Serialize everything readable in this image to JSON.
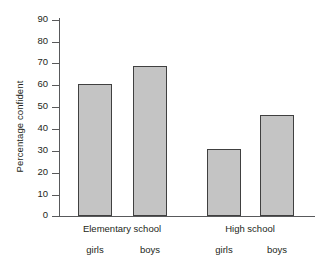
{
  "chart_data": {
    "type": "bar",
    "title": "",
    "xlabel": "",
    "ylabel": "Percentage confident",
    "ylim": [
      0,
      90
    ],
    "ytick_step": 10,
    "yticks": [
      90,
      80,
      70,
      60,
      50,
      40,
      30,
      20,
      10,
      0
    ],
    "grid": false,
    "legend": "none",
    "groups": [
      {
        "label": "Elementary school",
        "categories": [
          "girls",
          "boys"
        ],
        "values": [
          60,
          68
        ]
      },
      {
        "label": "High school",
        "categories": [
          "girls",
          "boys"
        ],
        "values": [
          30.5,
          46
        ]
      }
    ],
    "categories": [
      "girls",
      "boys",
      "girls",
      "boys"
    ],
    "values": [
      60,
      68,
      30.5,
      46
    ],
    "bar_fill_color": "#c4c4c4",
    "bar_border_color": "#404040",
    "axis_color": "#58595b",
    "background_color": "#ffffff"
  },
  "bars": [
    {
      "label": "girls",
      "value": 60,
      "left": 19,
      "width": 34,
      "height_pct": 66.67
    },
    {
      "label": "boys",
      "value": 68,
      "left": 74,
      "width": 34,
      "height_pct": 75.56
    },
    {
      "label": "girls",
      "value": 30.5,
      "left": 148,
      "width": 34,
      "height_pct": 33.89
    },
    {
      "label": "boys",
      "value": 46,
      "left": 201,
      "width": 34,
      "height_pct": 51.11
    }
  ],
  "yticks": [
    {
      "label": "90",
      "top": 20
    },
    {
      "label": "80",
      "top": 42
    },
    {
      "label": "70",
      "top": 63
    },
    {
      "label": "60",
      "top": 85
    },
    {
      "label": "50",
      "top": 107
    },
    {
      "label": "40",
      "top": 129
    },
    {
      "label": "30",
      "top": 151
    },
    {
      "label": "20",
      "top": 173
    },
    {
      "label": "10",
      "top": 195
    },
    {
      "label": "0",
      "top": 216
    }
  ],
  "group_labels": [
    {
      "text": "Elementary school",
      "center": 122
    },
    {
      "text": "High school",
      "center": 250
    }
  ],
  "sub_labels": [
    {
      "text": "girls",
      "center": 95
    },
    {
      "text": "boys",
      "center": 150
    },
    {
      "text": "girls",
      "center": 224
    },
    {
      "text": "boys",
      "center": 277
    }
  ]
}
